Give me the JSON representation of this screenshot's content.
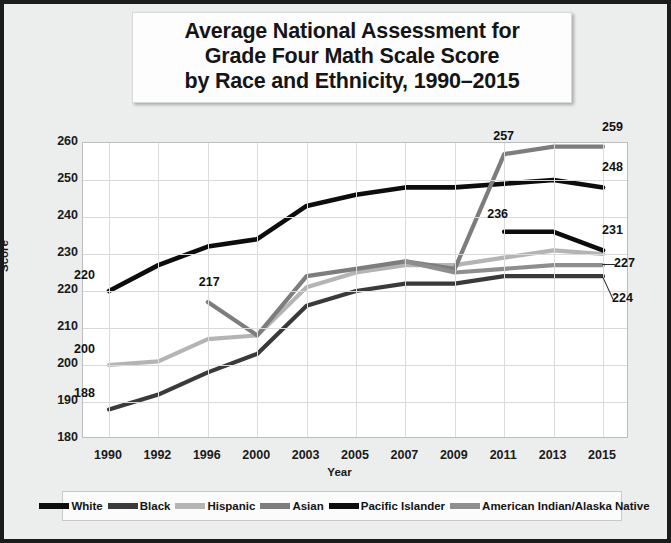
{
  "title": {
    "line1": "Average National Assessment for",
    "line2": "Grade Four Math Scale Score",
    "line3": "by Race and Ethnicity, 1990–2015"
  },
  "colors": {
    "white": "#0d0d0d",
    "black": "#3a3a3a",
    "hispanic": "#b4b4b4",
    "asian": "#7d7d7d",
    "pacific_islander": "#0d0d0d",
    "american_indian": "#8e8e8e",
    "frame": "#1b1b1b",
    "background": "#eceded",
    "plot_background": "#ffffff",
    "grid": "#d9d9d9"
  },
  "chart_data": {
    "type": "line",
    "title": "Average National Assessment for Grade Four Math Scale Score by Race and Ethnicity, 1990–2015",
    "xlabel": "Year",
    "ylabel": "Score",
    "categories": [
      "1990",
      "1992",
      "1996",
      "2000",
      "2003",
      "2005",
      "2007",
      "2009",
      "2011",
      "2013",
      "2015"
    ],
    "ylim": [
      180,
      260
    ],
    "yticks": [
      180,
      190,
      200,
      210,
      220,
      230,
      240,
      250,
      260
    ],
    "grid": true,
    "legend_position": "bottom",
    "series": [
      {
        "name": "White",
        "color_key": "white",
        "values": [
          220,
          227,
          232,
          234,
          243,
          246,
          248,
          248,
          249,
          250,
          248
        ]
      },
      {
        "name": "Black",
        "color_key": "black",
        "values": [
          188,
          192,
          198,
          203,
          216,
          220,
          222,
          222,
          224,
          224,
          224
        ]
      },
      {
        "name": "Hispanic",
        "color_key": "hispanic",
        "values": [
          200,
          201,
          207,
          208,
          221,
          225,
          227,
          227,
          229,
          231,
          230
        ]
      },
      {
        "name": "Asian",
        "color_key": "asian",
        "values": [
          null,
          null,
          217,
          208,
          224,
          226,
          228,
          226,
          257,
          259,
          259
        ]
      },
      {
        "name": "Pacific Islander",
        "color_key": "pacific_islander",
        "values": [
          null,
          null,
          null,
          null,
          null,
          null,
          null,
          null,
          236,
          236,
          231
        ]
      },
      {
        "name": "American Indian/Alaska Native",
        "color_key": "american_indian",
        "values": [
          null,
          null,
          null,
          null,
          null,
          null,
          228,
          225,
          226,
          227,
          227
        ]
      }
    ],
    "annotations": [
      {
        "text": "220",
        "series": "White",
        "category": "1990"
      },
      {
        "text": "188",
        "series": "Black",
        "category": "1990"
      },
      {
        "text": "200",
        "series": "Hispanic",
        "category": "1990"
      },
      {
        "text": "217",
        "series": "Asian",
        "category": "1996"
      },
      {
        "text": "257",
        "series": "Asian",
        "category": "2011"
      },
      {
        "text": "259",
        "series": "Asian",
        "category": "2015"
      },
      {
        "text": "248",
        "series": "White",
        "category": "2015"
      },
      {
        "text": "236",
        "series": "Pacific Islander",
        "category": "2011"
      },
      {
        "text": "231",
        "series": "Pacific Islander",
        "category": "2015"
      },
      {
        "text": "227",
        "series": "American Indian/Alaska Native",
        "category": "2015"
      },
      {
        "text": "224",
        "series": "Black",
        "category": "2015"
      }
    ]
  },
  "legend": {
    "items": [
      {
        "label": "White",
        "color_key": "white"
      },
      {
        "label": "Black",
        "color_key": "black"
      },
      {
        "label": "Hispanic",
        "color_key": "hispanic"
      },
      {
        "label": "Asian",
        "color_key": "asian"
      },
      {
        "label": "Pacific Islander",
        "color_key": "pacific_islander"
      },
      {
        "label": "American Indian/Alaska Native",
        "color_key": "american_indian"
      }
    ]
  }
}
